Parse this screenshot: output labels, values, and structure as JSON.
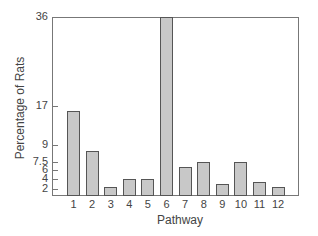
{
  "chart_data": {
    "type": "bar",
    "title": "",
    "xlabel": "Pathway",
    "ylabel": "Percentage of Rats",
    "categories": [
      "1",
      "2",
      "3",
      "4",
      "5",
      "6",
      "7",
      "8",
      "9",
      "10",
      "11",
      "12"
    ],
    "values": [
      16,
      8.5,
      2.5,
      4,
      4,
      36,
      6.5,
      7.5,
      3,
      7.5,
      3.5,
      2.5
    ],
    "ylim": [
      0,
      36
    ],
    "yticks": [
      {
        "value": 36,
        "label": "36",
        "y": 17
      },
      {
        "value": 17,
        "label": "17",
        "y": 106
      },
      {
        "value": 9,
        "label": "9",
        "y": 145
      },
      {
        "value": 7.5,
        "label": "7.5",
        "y": 162
      },
      {
        "value": 6,
        "label": "6",
        "y": 170
      },
      {
        "value": 4,
        "label": "4",
        "y": 179
      },
      {
        "value": 2,
        "label": "2",
        "y": 189
      }
    ],
    "grid": false,
    "legend": null,
    "bar_color": "#c8c8c8",
    "bar_edge_color": "#555555"
  }
}
